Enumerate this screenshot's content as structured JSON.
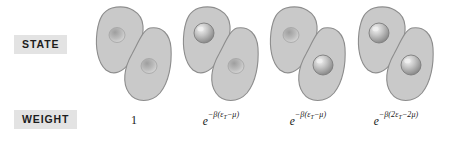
{
  "figure": {
    "rows": {
      "state_label": "STATE",
      "weight_label": "WEIGHT"
    },
    "colors": {
      "lobe_fill": "#c9c9c9",
      "lobe_stroke": "#8a8a8a",
      "sphere_fill": "#b9b9b9",
      "sphere_highlight": "#eeeeee",
      "dimple_fill": "#b0b0b0",
      "label_background": "#e3e3e3",
      "label_text": "#1d1d1d",
      "page_background": "#ffffff"
    },
    "states": [
      {
        "id": "state-empty-empty",
        "upper_site": "empty",
        "lower_site": "empty",
        "occupancy_count": 0
      },
      {
        "id": "state-occupied-empty",
        "upper_site": "occupied",
        "lower_site": "empty",
        "occupancy_count": 1
      },
      {
        "id": "state-empty-occupied",
        "upper_site": "empty",
        "lower_site": "occupied",
        "occupancy_count": 1
      },
      {
        "id": "state-occupied-occupied",
        "upper_site": "occupied",
        "lower_site": "occupied",
        "occupancy_count": 2
      }
    ],
    "weights": [
      {
        "id": "weight-1",
        "text": "1",
        "is_single": true,
        "base": "",
        "exponent_pre": "",
        "exponent_sub": "",
        "exponent_post": ""
      },
      {
        "id": "weight-2",
        "text": "e^{-β(ε_T-μ)}",
        "is_single": false,
        "base": "e",
        "exponent_pre": "−β(ε",
        "exponent_sub": "T",
        "exponent_post": "−μ)"
      },
      {
        "id": "weight-3",
        "text": "e^{-β(ε_T-μ)}",
        "is_single": false,
        "base": "e",
        "exponent_pre": "−β(ε",
        "exponent_sub": "T",
        "exponent_post": "−μ)"
      },
      {
        "id": "weight-4",
        "text": "e^{-β(2ε_T-2μ)}",
        "is_single": false,
        "base": "e",
        "exponent_pre": "−β(2ε",
        "exponent_sub": "T",
        "exponent_post": "−2μ)"
      }
    ]
  }
}
